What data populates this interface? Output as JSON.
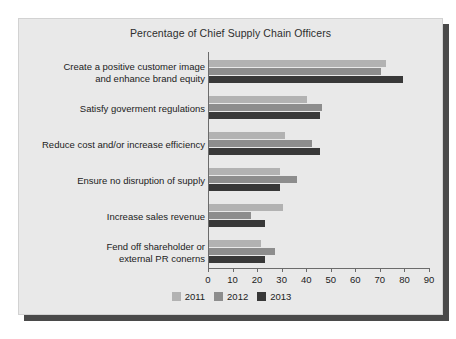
{
  "chart_data": {
    "type": "bar",
    "orientation": "horizontal",
    "title": "Percentage of Chief Supply Chain Officers",
    "xlabel": "",
    "ylabel": "",
    "xlim": [
      0,
      90
    ],
    "xticks": [
      0,
      10,
      20,
      30,
      40,
      50,
      60,
      70,
      80,
      90
    ],
    "grid": false,
    "legend_position": "bottom",
    "categories": [
      "Create a positive customer image\nand enhance brand equity",
      "Satisfy goverment regulations",
      "Reduce cost and/or increase efficiency",
      "Ensure no disruption of supply",
      "Increase sales revenue",
      "Fend off shareholder or\nexternal PR conerns"
    ],
    "series": [
      {
        "name": "2011",
        "color": "#b2b2b2",
        "values": [
          72,
          40,
          31,
          29,
          30,
          21
        ]
      },
      {
        "name": "2012",
        "color": "#8d8d8d",
        "values": [
          70,
          46,
          42,
          36,
          17,
          27
        ]
      },
      {
        "name": "2013",
        "color": "#383838",
        "values": [
          79,
          45,
          45,
          29,
          23,
          23
        ]
      }
    ]
  },
  "categories_display": [
    {
      "line1": "Create a positive customer image",
      "line2": "and enhance brand equity"
    },
    {
      "line1": "Satisfy goverment regulations",
      "line2": ""
    },
    {
      "line1": "Reduce cost and/or increase efficiency",
      "line2": ""
    },
    {
      "line1": "Ensure no disruption of supply",
      "line2": ""
    },
    {
      "line1": "Increase sales revenue",
      "line2": ""
    },
    {
      "line1": "Fend off shareholder or",
      "line2": "external PR conerns"
    }
  ],
  "colors": {
    "panel_background": "#e9e9e9",
    "page_background": "#ffffff",
    "shadow": "#4a4a4a",
    "axis": "#6b6b6b",
    "text": "#222222",
    "series_2011": "#b2b2b2",
    "series_2012": "#8d8d8d",
    "series_2013": "#383838"
  }
}
